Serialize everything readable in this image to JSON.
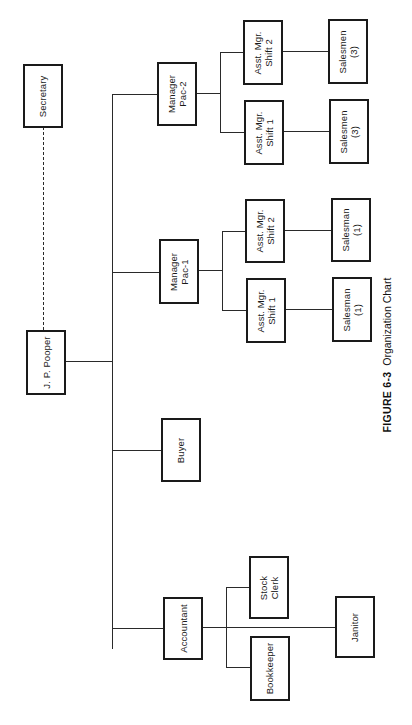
{
  "figure": {
    "number": "FIGURE 6-3",
    "title": "Organization Chart"
  },
  "chart": {
    "orientation": "rotated 90° counter-clockwise (root at left, levels progress to the right)",
    "root": {
      "label": "J. P. Pooper",
      "staff": {
        "label": "Secretary",
        "connection": "dashed"
      },
      "children": [
        {
          "label": "Manager\nPac-2",
          "children": [
            {
              "label": "Asst. Mgr.\nShift 2",
              "children": [
                {
                  "label": "Salesmen\n(3)"
                }
              ]
            },
            {
              "label": "Asst. Mgr.\nShift 1",
              "children": [
                {
                  "label": "Salesmen\n(3)"
                }
              ]
            }
          ]
        },
        {
          "label": "Manager\nPac-1",
          "children": [
            {
              "label": "Asst. Mgr.\nShift 2",
              "children": [
                {
                  "label": "Salesman\n(1)"
                }
              ]
            },
            {
              "label": "Asst. Mgr.\nShift 1",
              "children": [
                {
                  "label": "Salesman\n(1)"
                }
              ]
            }
          ]
        },
        {
          "label": "Buyer"
        },
        {
          "label": "Accountant",
          "children": [
            {
              "label": "Stock\nClerk"
            },
            {
              "label": "Bookkeeper"
            },
            {
              "label": "Janitor"
            }
          ]
        }
      ]
    }
  },
  "nodes": {
    "secretary": "Secretary",
    "ceo": "J. P. Pooper",
    "manager_pac2": "Manager\nPac-2",
    "manager_pac1": "Manager\nPac-1",
    "buyer": "Buyer",
    "accountant": "Accountant",
    "pac2_asst_shift2": "Asst. Mgr.\nShift 2",
    "pac2_asst_shift1": "Asst. Mgr.\nShift 1",
    "pac2_salesmen_a": "Salesmen\n(3)",
    "pac2_salesmen_b": "Salesmen\n(3)",
    "pac1_asst_shift2": "Asst. Mgr.\nShift 2",
    "pac1_asst_shift1": "Asst. Mgr.\nShift 1",
    "pac1_salesman_a": "Salesman\n(1)",
    "pac1_salesman_b": "Salesman\n(1)",
    "stock_clerk": "Stock\nClerk",
    "bookkeeper": "Bookkeeper",
    "janitor": "Janitor"
  },
  "colors": {
    "line": "#2a2a2a",
    "box_border": "#1a1a1a",
    "background": "#ffffff"
  }
}
